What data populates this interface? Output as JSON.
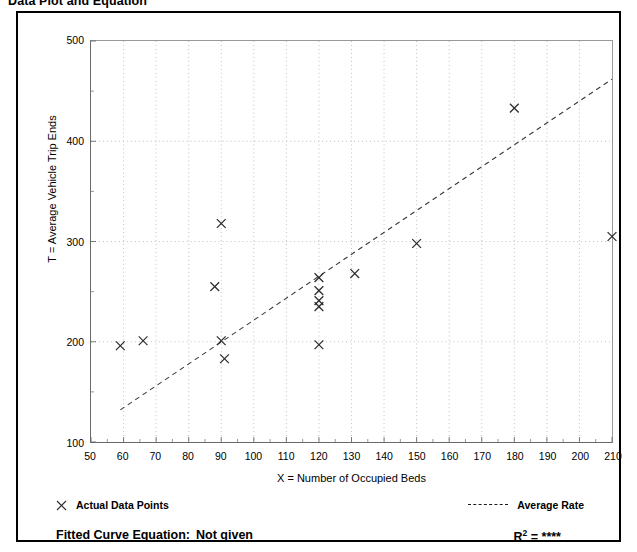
{
  "title": "Data Plot and Equation",
  "axes": {
    "x_title": "X = Number of Occupied Beds",
    "y_title": "T = Average Vehicle Trip Ends"
  },
  "legend": {
    "data_points_label": "Actual Data Points",
    "average_rate_label": "Average Rate",
    "data_points_marker": "cross-marker-icon",
    "average_rate_marker": "dashed-line-icon"
  },
  "footer": {
    "fitted_curve_label": "Fitted Curve Equation:",
    "fitted_curve_value": "Not given",
    "r_squared_label": "R",
    "r_squared_exponent": "2",
    "r_squared_equals": "=",
    "r_squared_value": "****"
  },
  "colors": {
    "frame": "#000000",
    "axis": "#6a6a6a",
    "grid": "#b9b9c4",
    "marker": "#2b2b2b",
    "trend": "#3a3a3a",
    "background": "#ffffff"
  },
  "chart_data": {
    "type": "scatter",
    "title": "Data Plot and Equation",
    "xlabel": "X = Number of Occupied Beds",
    "ylabel": "T = Average Vehicle Trip Ends",
    "xlim": [
      50,
      210
    ],
    "ylim": [
      100,
      500
    ],
    "xticks": [
      50,
      60,
      70,
      80,
      90,
      100,
      110,
      120,
      130,
      140,
      150,
      160,
      170,
      180,
      190,
      200,
      210
    ],
    "yticks": [
      100,
      200,
      300,
      400,
      500
    ],
    "grid": true,
    "legend_position": "below-plot",
    "series": [
      {
        "name": "Actual Data Points",
        "type": "scatter",
        "marker": "x",
        "points": [
          {
            "x": 59,
            "y": 196
          },
          {
            "x": 66,
            "y": 201
          },
          {
            "x": 88,
            "y": 255
          },
          {
            "x": 90,
            "y": 318
          },
          {
            "x": 90,
            "y": 201
          },
          {
            "x": 91,
            "y": 183
          },
          {
            "x": 120,
            "y": 264
          },
          {
            "x": 120,
            "y": 251
          },
          {
            "x": 120,
            "y": 241
          },
          {
            "x": 120,
            "y": 235
          },
          {
            "x": 120,
            "y": 197
          },
          {
            "x": 131,
            "y": 268
          },
          {
            "x": 150,
            "y": 298
          },
          {
            "x": 180,
            "y": 433
          },
          {
            "x": 210,
            "y": 305
          }
        ]
      },
      {
        "name": "Average Rate",
        "type": "line",
        "style": "dashed",
        "points": [
          {
            "x": 59,
            "y": 132
          },
          {
            "x": 210,
            "y": 462
          }
        ]
      }
    ]
  }
}
